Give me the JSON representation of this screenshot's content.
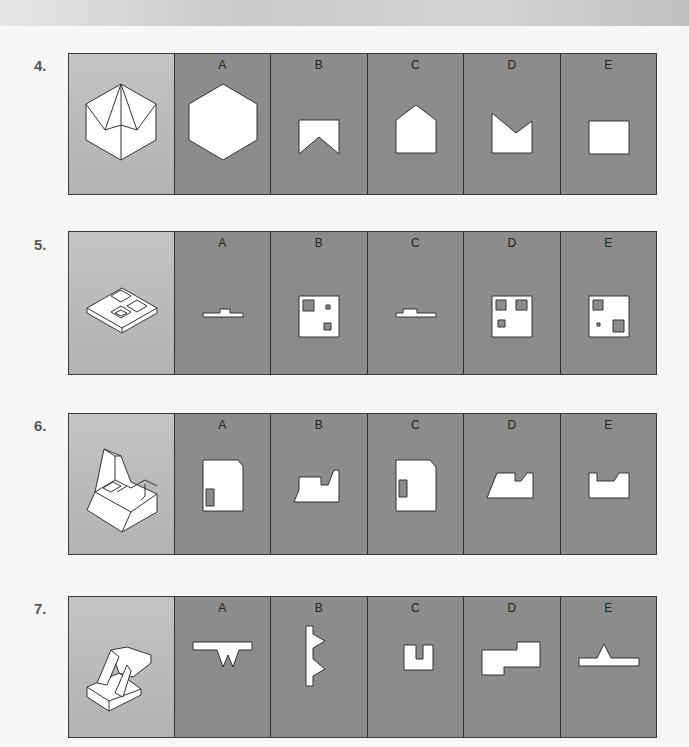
{
  "questions": [
    {
      "number": "4.",
      "options": [
        "A",
        "B",
        "C",
        "D",
        "E"
      ],
      "figure": "hexagonal-pyramid-solid",
      "option_shapes": [
        "hexagon",
        "rectangle-with-v-notch-bottom",
        "pentagon-house",
        "rectangle-with-v-notch-top",
        "rectangle"
      ]
    },
    {
      "number": "5.",
      "options": [
        "A",
        "B",
        "C",
        "D",
        "E"
      ],
      "figure": "plate-with-three-recesses",
      "option_shapes": [
        "thin-stepped-profile",
        "square-three-holes",
        "thin-stepped-profile",
        "square-three-holes",
        "square-three-holes"
      ]
    },
    {
      "number": "6.",
      "options": [
        "A",
        "B",
        "C",
        "D",
        "E"
      ],
      "figure": "stepped-block-with-slot",
      "option_shapes": [
        "chamfered-rect-with-slot",
        "stepped-profile",
        "chamfered-rect-with-slot",
        "stepped-profile",
        "notched-profile"
      ]
    },
    {
      "number": "7.",
      "options": [
        "A",
        "B",
        "C",
        "D",
        "E"
      ],
      "figure": "block-with-wedges",
      "option_shapes": [
        "bar-with-two-teeth-down",
        "bar-with-two-teeth-right",
        "u-shape",
        "offset-rectangles",
        "bar-with-peak"
      ]
    }
  ],
  "colors": {
    "option_bg": "#8c8c8c",
    "figure_bg": "#bcbcbc",
    "border": "#333333",
    "shape_fill": "#ffffff"
  }
}
